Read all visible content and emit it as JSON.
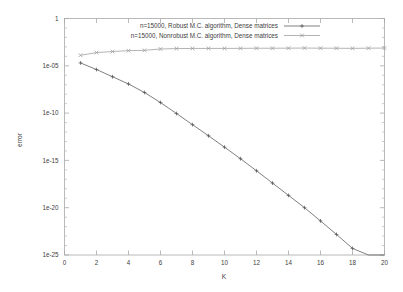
{
  "chart_data": {
    "type": "line",
    "title": "",
    "xlabel": "K",
    "ylabel": "error",
    "xlim": [
      0,
      20
    ],
    "ylim": [
      1e-25,
      1
    ],
    "yscale": "log",
    "xscale": "linear",
    "grid": false,
    "legend_position": "top-center-inside",
    "xticks": [
      0,
      2,
      4,
      6,
      8,
      10,
      12,
      14,
      16,
      18,
      20
    ],
    "xticklabels": [
      "0",
      "2",
      "4",
      "6",
      "8",
      "10",
      "12",
      "14",
      "16",
      "18",
      "20"
    ],
    "yticks": [
      1,
      1e-05,
      1e-10,
      1e-15,
      1e-20,
      1e-25
    ],
    "yticklabels": [
      "1",
      "1e-05",
      "1e-10",
      "1e-15",
      "1e-20",
      "1e-25"
    ],
    "x": [
      1,
      2,
      3,
      4,
      5,
      6,
      7,
      8,
      9,
      10,
      11,
      12,
      13,
      14,
      15,
      16,
      17,
      18,
      19,
      20
    ],
    "series": [
      {
        "name": "n=15000, Robust M.C. algorithm, Dense matrices",
        "marker": "plus",
        "color": "#555555",
        "values": [
          2e-05,
          4e-06,
          7e-07,
          1.2e-07,
          1.5e-08,
          1.3e-09,
          9e-11,
          6e-12,
          4e-13,
          2.5e-14,
          1.5e-15,
          8e-17,
          4e-18,
          2e-19,
          1e-20,
          4e-22,
          1.5e-23,
          5e-25,
          9e-26,
          1.5e-26
        ]
      },
      {
        "name": "n=15000, Nonrobust M.C. algorithm, Dense matrices",
        "marker": "cross",
        "color": "#9a9a9a",
        "values": [
          0.00013,
          0.00025,
          0.00032,
          0.0004,
          0.00043,
          0.0006,
          0.00066,
          0.00068,
          0.00069,
          0.00069,
          0.0007,
          0.00072,
          0.00072,
          0.00073,
          0.00075,
          0.00073,
          0.00072,
          0.0007,
          0.00073,
          0.00075
        ]
      }
    ]
  },
  "legend": {
    "entries": [
      {
        "label": "n=15000, Robust M.C. algorithm, Dense matrices"
      },
      {
        "label": "n=15000, Nonrobust M.C. algorithm, Dense matrices"
      }
    ]
  },
  "axes": {
    "x_title": "K",
    "y_title": "error"
  }
}
